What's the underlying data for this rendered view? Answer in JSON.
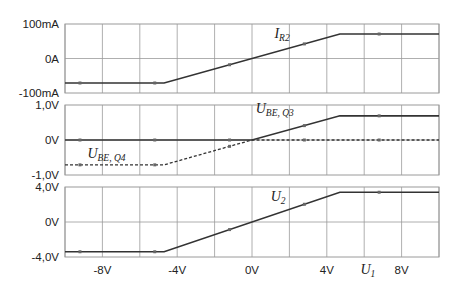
{
  "chart_data": [
    {
      "type": "line",
      "panel": "top",
      "ylabel": "",
      "x_range": [
        -10,
        10
      ],
      "ylim": [
        -100,
        100
      ],
      "y_unit": "mA",
      "y_ticks": [
        {
          "v": 100,
          "label": "100mA"
        },
        {
          "v": 0,
          "label": "0A"
        },
        {
          "v": -100,
          "label": "-100mA"
        }
      ],
      "series": [
        {
          "name": "I_R2",
          "label_main": "I",
          "label_sub": "R2",
          "style": "solid",
          "x": [
            -10,
            -4.7,
            4.7,
            10
          ],
          "y": [
            -71,
            -71,
            71,
            71
          ]
        }
      ],
      "label_pos": {
        "x": 1.2,
        "y": 60
      }
    },
    {
      "type": "line",
      "panel": "middle",
      "x_range": [
        -10,
        10
      ],
      "ylim": [
        -1.0,
        1.0
      ],
      "y_unit": "V",
      "y_ticks": [
        {
          "v": 1.0,
          "label": "1,0V"
        },
        {
          "v": 0,
          "label": "0V"
        },
        {
          "v": -1.0,
          "label": "-1,0V"
        }
      ],
      "series": [
        {
          "name": "U_BE,Q3",
          "label_main": "U",
          "label_sub": "BE, Q3",
          "style": "solid",
          "x": [
            -10,
            0,
            4.7,
            10
          ],
          "y": [
            0,
            0,
            0.69,
            0.69
          ]
        },
        {
          "name": "U_BE,Q4",
          "label_main": "U",
          "label_sub": "BE, Q4",
          "style": "dashed",
          "x": [
            -10,
            -4.7,
            0,
            10
          ],
          "y": [
            -0.71,
            -0.71,
            0,
            0
          ]
        }
      ],
      "label_pos": [
        {
          "x": 0.2,
          "y": 0.78
        },
        {
          "x": -8.8,
          "y": -0.5
        }
      ]
    },
    {
      "type": "line",
      "panel": "bottom",
      "x_range": [
        -10,
        10
      ],
      "ylim": [
        -4.0,
        4.0
      ],
      "y_unit": "V",
      "xlabel": "U_1",
      "xlabel_main": "U",
      "xlabel_sub": "1",
      "x_ticks": [
        {
          "v": -8,
          "label": "-8V"
        },
        {
          "v": -4,
          "label": "-4V"
        },
        {
          "v": 0,
          "label": "0V"
        },
        {
          "v": 4,
          "label": "4V"
        },
        {
          "v": 8,
          "label": "8V"
        }
      ],
      "y_ticks": [
        {
          "v": 4.0,
          "label": "4,0V"
        },
        {
          "v": 0,
          "label": "0V"
        },
        {
          "v": -4.0,
          "label": "-4,0V"
        }
      ],
      "series": [
        {
          "name": "U_2",
          "label_main": "U",
          "label_sub": "2",
          "style": "solid",
          "x": [
            -10,
            -4.7,
            4.7,
            10
          ],
          "y": [
            -3.4,
            -3.4,
            3.4,
            3.4
          ]
        }
      ],
      "label_pos": {
        "x": 1.0,
        "y": 2.4
      }
    }
  ],
  "layout": {
    "x_left_px": 65,
    "x_right_px": 439,
    "panels": [
      {
        "top": 24,
        "bottom": 93
      },
      {
        "top": 105,
        "bottom": 175
      },
      {
        "top": 187,
        "bottom": 257
      }
    ],
    "grid_color": "#9a9a9a",
    "line_color": "#333333",
    "x_grid_step": 2
  }
}
